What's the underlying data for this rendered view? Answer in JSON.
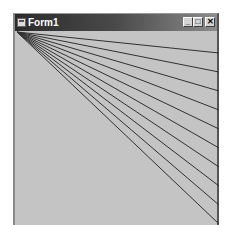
{
  "window": {
    "title": "Form1",
    "icon": "app-form-icon",
    "controls": {
      "minimize": "_",
      "maximize": "□",
      "close": "✕"
    }
  },
  "canvas": {
    "background": "#c4c4c4",
    "line_color": "#303030",
    "origin": [
      2,
      1
    ],
    "line_endpoints_right_edge": [
      [
        204,
        22
      ],
      [
        204,
        41
      ],
      [
        204,
        60
      ],
      [
        204,
        79
      ],
      [
        204,
        98
      ],
      [
        204,
        117
      ],
      [
        204,
        136
      ],
      [
        204,
        155
      ],
      [
        204,
        174
      ],
      [
        204,
        193
      ]
    ]
  }
}
